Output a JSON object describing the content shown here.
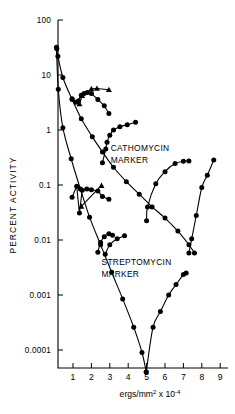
{
  "figure": {
    "name": "uv-inactivation-semilog-plot",
    "background": "#ffffff",
    "ink_color": "#000000"
  },
  "chart_data": {
    "type": "line",
    "title": "",
    "subtitle": "",
    "xlabel": "ergs/mm² x 10⁻⁴",
    "ylabel": "PERCENT ACTIVITY",
    "xscale": "linear",
    "yscale": "log",
    "xlim": [
      0,
      9.6
    ],
    "ylim": [
      3e-05,
      100
    ],
    "grid": false,
    "legend_position": "none",
    "xticks": [
      1,
      2,
      3,
      4,
      5,
      6,
      7,
      8,
      9
    ],
    "xtick_labels": [
      "1",
      "2",
      "3",
      "4",
      "5",
      "6",
      "7",
      "8",
      "9"
    ],
    "yticks": [
      100,
      10,
      1,
      0.1,
      0.01,
      0.001,
      0.0001
    ],
    "ytick_labels": [
      "100",
      "10",
      "1",
      "0.1",
      "0.01",
      "0.001",
      "0.0001"
    ],
    "annotations": [
      {
        "name": "cathomycin-marker-label",
        "text": "CATHOMYCIN",
        "x": 3.05,
        "y": 0.42
      },
      {
        "name": "cathomycin-marker-label-line2",
        "text": "MARKER",
        "x": 3.05,
        "y": 0.25
      },
      {
        "name": "streptomycin-marker-label",
        "text": "STREPTOMYCIN",
        "x": 2.55,
        "y": 0.0035
      },
      {
        "name": "streptomycin-marker-label-line2",
        "text": "MARKER",
        "x": 2.55,
        "y": 0.0021
      }
    ],
    "series": [
      {
        "name": "cathomycin-survival-curve",
        "marker": "circle",
        "style": "smooth-line",
        "x": [
          0.12,
          0.18,
          0.45,
          0.95,
          1.45,
          2.05,
          2.6,
          3.2,
          3.9,
          4.6,
          5.3,
          6.0,
          6.7,
          7.3,
          7.6
        ],
        "y": [
          30,
          22,
          9.0,
          3.6,
          1.6,
          0.75,
          0.4,
          0.21,
          0.115,
          0.068,
          0.04,
          0.025,
          0.0145,
          0.0082,
          0.0058
        ]
      },
      {
        "name": "streptomycin-survival-curve",
        "marker": "circle",
        "style": "smooth-line",
        "x": [
          0.1,
          0.2,
          0.45,
          0.9,
          1.4,
          1.9,
          2.5,
          3.1,
          3.7,
          4.3,
          4.75,
          4.98
        ],
        "y": [
          32,
          5.5,
          1.1,
          0.3,
          0.085,
          0.026,
          0.0082,
          0.0026,
          0.00085,
          0.00026,
          9e-05,
          4e-05
        ]
      },
      {
        "name": "cathomycin-peak-cluster",
        "marker": "circle",
        "style": "line",
        "x": [
          0.95,
          1.15,
          1.3,
          1.45,
          1.6,
          1.78,
          2.0,
          2.35,
          2.7,
          2.95
        ],
        "y": [
          3.7,
          3.2,
          3.4,
          4.3,
          4.6,
          4.8,
          4.6,
          3.6,
          2.75,
          2.0
        ]
      },
      {
        "name": "cathomycin-peak-cluster-triangles",
        "marker": "triangle",
        "style": "line",
        "x": [
          1.35,
          1.5,
          2.0,
          2.3,
          2.95
        ],
        "y": [
          3.0,
          4.2,
          5.6,
          5.7,
          5.4
        ]
      },
      {
        "name": "cathomycin-recovery-curve",
        "marker": "circle",
        "style": "smooth-line",
        "x": [
          2.6,
          2.78,
          2.85,
          3.0,
          3.2,
          3.55,
          3.95,
          4.4
        ],
        "y": [
          0.255,
          0.45,
          0.6,
          0.8,
          1.0,
          1.15,
          1.25,
          1.38
        ]
      },
      {
        "name": "streptomycin-mid-cluster",
        "marker": "circle",
        "style": "line",
        "x": [
          0.95,
          1.2,
          1.35,
          1.5,
          1.75,
          2.0,
          2.35,
          2.6,
          2.95
        ],
        "y": [
          0.06,
          0.095,
          0.031,
          0.08,
          0.085,
          0.082,
          0.078,
          0.062,
          0.055
        ]
      },
      {
        "name": "streptomycin-mid-cluster-triangles",
        "marker": "triangle",
        "style": "line",
        "x": [
          1.45,
          2.55
        ],
        "y": [
          0.041,
          0.098
        ]
      },
      {
        "name": "streptomycin-low-cluster",
        "marker": "circle",
        "style": "smooth-line",
        "x": [
          2.35,
          2.5,
          2.7,
          2.95,
          3.15
        ],
        "y": [
          0.006,
          0.009,
          0.0115,
          0.013,
          0.0122
        ]
      },
      {
        "name": "streptomycin-low-cluster-b",
        "marker": "circle",
        "style": "smooth-line",
        "x": [
          2.75,
          3.0,
          3.4,
          3.8
        ],
        "y": [
          0.0055,
          0.0082,
          0.0105,
          0.012
        ]
      },
      {
        "name": "right-recovery-curve-1",
        "marker": "circle",
        "style": "smooth-line",
        "x": [
          5.0,
          5.05,
          5.5,
          6.0,
          6.55,
          7.0,
          7.3
        ],
        "y": [
          0.0225,
          0.04,
          0.105,
          0.175,
          0.245,
          0.27,
          0.272
        ]
      },
      {
        "name": "right-recovery-curve-2",
        "marker": "circle",
        "style": "smooth-line",
        "x": [
          7.3,
          7.45,
          7.7,
          8.0,
          8.3,
          8.65
        ],
        "y": [
          0.0058,
          0.0105,
          0.028,
          0.09,
          0.15,
          0.285
        ]
      },
      {
        "name": "bottom-v-recovery-curve",
        "marker": "circle",
        "style": "smooth-line",
        "x": [
          4.98,
          5.35,
          5.75,
          6.2,
          6.6,
          7.0,
          7.15
        ],
        "y": [
          4e-05,
          0.00026,
          0.0005,
          0.001,
          0.00155,
          0.00235,
          0.0025
        ]
      }
    ]
  }
}
